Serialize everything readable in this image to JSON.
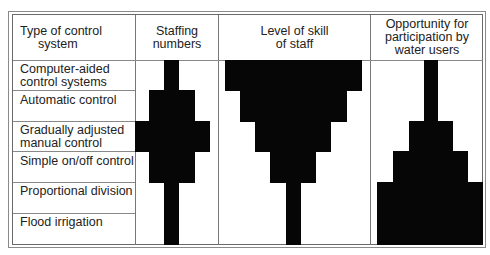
{
  "table": {
    "headers": {
      "type": "Type of  control\n      system",
      "type_line1": "Type of  control",
      "type_line2": "system",
      "staffing_line1": "Staffing",
      "staffing_line2": "numbers",
      "skill_line1": "Level of skill",
      "skill_line2": "of staff",
      "opportunity_line1": "Opportunity for",
      "opportunity_line2": "participation by",
      "opportunity_line3": "water users"
    },
    "rows": [
      {
        "line1": "Computer-aided",
        "line2": "control systems",
        "staffing": 1,
        "skill": 5,
        "opportunity": 1
      },
      {
        "line1": "Automatic control",
        "line2": "",
        "staffing": 3,
        "skill": 4,
        "opportunity": 1
      },
      {
        "line1": "Gradually adjusted",
        "line2": "manual control",
        "staffing": 5,
        "skill": 3,
        "opportunity": 3
      },
      {
        "line1": "Simple on/off control",
        "line2": "",
        "staffing": 3,
        "skill": 2,
        "opportunity": 5
      },
      {
        "line1": "Proportional division",
        "line2": "",
        "staffing": 1,
        "skill": 1,
        "opportunity": 7
      },
      {
        "line1": "Flood irrigation",
        "line2": "",
        "staffing": 1,
        "skill": 1,
        "opportunity": 7
      }
    ]
  },
  "colors": {
    "bar": "#060606",
    "border": "#777777"
  }
}
